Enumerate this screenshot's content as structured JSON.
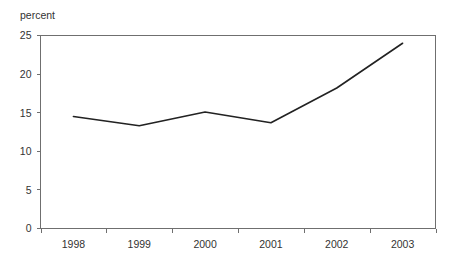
{
  "chart_data": {
    "type": "line",
    "title": "",
    "subtitle": "",
    "xlabel": "",
    "ylabel": "percent",
    "ylim": [
      0,
      25
    ],
    "ytick_values": [
      0,
      5,
      10,
      15,
      20,
      25
    ],
    "ytick_labels": [
      "0",
      "5",
      "10",
      "15",
      "20",
      "25"
    ],
    "grid": false,
    "legend": false,
    "legend_position": "none",
    "categories": [
      "1998",
      "1999",
      "2000",
      "2001",
      "2002",
      "2003"
    ],
    "values": [
      14.5,
      13.3,
      15.1,
      13.7,
      18.2,
      24.0
    ],
    "series": [
      {
        "name": "percent",
        "values": [
          14.5,
          13.3,
          15.1,
          13.7,
          18.2,
          24.0
        ],
        "color": "#222222"
      }
    ],
    "annotations": []
  },
  "axes": {
    "y_axis_title": "percent",
    "y_ticks": [
      "25",
      "20",
      "15",
      "10",
      "5",
      "0"
    ],
    "x_ticks": [
      "1998",
      "1999",
      "2000",
      "2001",
      "2002",
      "2003"
    ]
  },
  "colors": {
    "line": "#222222",
    "frame": "#6f6f6f",
    "text": "#333333",
    "background": "#ffffff"
  }
}
